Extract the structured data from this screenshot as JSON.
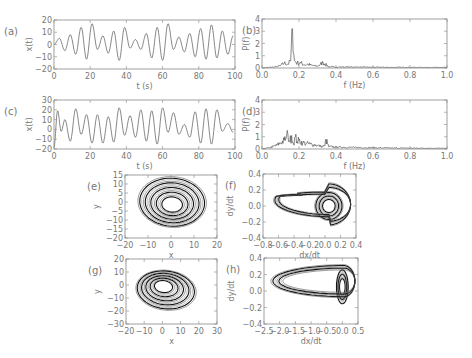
{
  "figure": {
    "width": 472,
    "height": 358,
    "frame_color": "#888888",
    "text_color": "#777777",
    "line_color_ts": "#555555",
    "line_color_phase": "#111111"
  },
  "chart_data": [
    {
      "id": "a",
      "panel_label": "(a)",
      "type": "line",
      "title": "",
      "xlabel": "t (s)",
      "ylabel": "x(t)",
      "xlim": [
        0,
        100
      ],
      "ylim": [
        -20,
        20
      ],
      "xticks": [
        0,
        20,
        40,
        60,
        80,
        100
      ],
      "yticks": [
        -20,
        -10,
        0,
        10,
        20
      ],
      "grid": false,
      "box": {
        "x": 54,
        "y": 20,
        "w": 181,
        "h": 49
      },
      "signal": {
        "kind": "chaotic_timeseries",
        "amplitude_range": [
          -14,
          17
        ],
        "approx_period_s": 6.0,
        "samples": 600
      },
      "x": [
        0,
        3,
        6,
        9,
        12,
        15,
        18,
        21,
        24,
        27,
        30,
        33,
        36,
        39,
        42,
        45,
        48,
        51,
        54,
        57,
        60,
        63,
        66,
        69,
        72,
        75,
        78,
        81,
        84,
        87,
        90,
        93,
        96,
        99
      ],
      "values": [
        0,
        5,
        -5,
        8,
        -8,
        14,
        -12,
        17,
        -4,
        7,
        -7,
        11,
        -13,
        14,
        -3,
        4,
        -4,
        9,
        -11,
        14,
        -13,
        17,
        -4,
        6,
        -6,
        9,
        -10,
        13,
        -12,
        16,
        -11,
        11,
        -8,
        7
      ]
    },
    {
      "id": "b",
      "panel_label": "(b)",
      "type": "line",
      "title": "",
      "xlabel": "f (Hz)",
      "ylabel": "P(f)",
      "xlim": [
        0.0,
        1.0
      ],
      "ylim": [
        0,
        4
      ],
      "xticks": [
        0.0,
        0.2,
        0.4,
        0.6,
        0.8,
        1.0
      ],
      "xtick_labels": [
        "0.0",
        "0.2",
        "0.4",
        "0.6",
        "0.8",
        "1.0"
      ],
      "yticks": [
        0,
        1,
        2,
        3,
        4
      ],
      "grid": false,
      "box": {
        "x": 262,
        "y": 19,
        "w": 185,
        "h": 49
      },
      "x": [
        0.0,
        0.04,
        0.08,
        0.1,
        0.12,
        0.14,
        0.155,
        0.165,
        0.175,
        0.19,
        0.21,
        0.23,
        0.25,
        0.27,
        0.3,
        0.33,
        0.36,
        0.4,
        0.5,
        0.6,
        0.7,
        0.8,
        0.9,
        1.0
      ],
      "values": [
        0.0,
        0.05,
        0.1,
        0.2,
        0.4,
        0.3,
        0.6,
        3.2,
        0.6,
        0.4,
        0.4,
        0.25,
        0.3,
        0.2,
        0.15,
        0.45,
        0.1,
        0.08,
        0.08,
        0.06,
        0.05,
        0.05,
        0.04,
        0.04
      ],
      "annotations": [
        {
          "text": "dominant peak",
          "x": 0.165,
          "y": 3.2
        }
      ]
    },
    {
      "id": "c",
      "panel_label": "(c)",
      "type": "line",
      "title": "",
      "xlabel": "t (s)",
      "ylabel": "x(t)",
      "xlim": [
        0,
        100
      ],
      "ylim": [
        -20,
        30
      ],
      "xticks": [
        0,
        20,
        40,
        60,
        80,
        100
      ],
      "yticks": [
        -20,
        -10,
        0,
        10,
        20,
        30
      ],
      "grid": false,
      "box": {
        "x": 54,
        "y": 100,
        "w": 181,
        "h": 49
      },
      "x": [
        0,
        2,
        4,
        6,
        9,
        12,
        15,
        18,
        21,
        24,
        27,
        30,
        33,
        36,
        39,
        42,
        45,
        48,
        51,
        54,
        57,
        60,
        63,
        66,
        69,
        72,
        75,
        78,
        81,
        84,
        87,
        90,
        93,
        96,
        99
      ],
      "values": [
        -18,
        19,
        -2,
        10,
        -12,
        21,
        -5,
        15,
        -14,
        15,
        -14,
        13,
        -13,
        22,
        -6,
        14,
        -8,
        20,
        -12,
        19,
        -15,
        22,
        -3,
        17,
        -5,
        5,
        -8,
        18,
        -14,
        21,
        -15,
        20,
        -2,
        6,
        -3
      ]
    },
    {
      "id": "d",
      "panel_label": "(d)",
      "type": "line",
      "title": "",
      "xlabel": "f (Hz)",
      "ylabel": "P(f)",
      "xlim": [
        0.0,
        1.0
      ],
      "ylim": [
        0,
        4
      ],
      "xticks": [
        0.0,
        0.2,
        0.4,
        0.6,
        0.8,
        1.0
      ],
      "xtick_labels": [
        "0.0",
        "0.2",
        "0.4",
        "0.6",
        "0.8",
        "1.0"
      ],
      "yticks": [
        0,
        1,
        2,
        3,
        4
      ],
      "grid": false,
      "box": {
        "x": 262,
        "y": 100,
        "w": 185,
        "h": 49
      },
      "x": [
        0.0,
        0.04,
        0.08,
        0.1,
        0.12,
        0.13,
        0.14,
        0.15,
        0.16,
        0.17,
        0.18,
        0.19,
        0.2,
        0.22,
        0.24,
        0.26,
        0.28,
        0.3,
        0.32,
        0.34,
        0.345,
        0.36,
        0.4,
        0.5,
        0.6,
        0.7,
        0.8,
        0.9,
        1.0
      ],
      "values": [
        0.0,
        0.1,
        0.3,
        0.5,
        0.7,
        0.9,
        1.2,
        0.6,
        1.1,
        0.4,
        1.0,
        0.6,
        0.7,
        0.5,
        0.45,
        0.4,
        0.35,
        0.3,
        0.2,
        0.25,
        0.8,
        0.2,
        0.15,
        0.12,
        0.1,
        0.08,
        0.07,
        0.06,
        0.05
      ]
    },
    {
      "id": "e",
      "panel_label": "(e)",
      "type": "scatter",
      "title": "",
      "xlabel": "x",
      "ylabel": "y",
      "xlim": [
        -20,
        20
      ],
      "ylim": [
        -20,
        15
      ],
      "xticks": [
        -20,
        -10,
        0,
        10,
        20
      ],
      "yticks": [
        -20,
        -15,
        -10,
        -5,
        0,
        5,
        10,
        15
      ],
      "grid": false,
      "box": {
        "x": 125,
        "y": 175,
        "w": 92,
        "h": 63
      },
      "attractor": {
        "center": [
          0,
          0
        ],
        "radius_x": [
          4,
          15
        ],
        "radius_y": [
          4,
          15
        ],
        "tilt_deg": -20,
        "loops": 14,
        "tail_to": [
          15,
          3
        ]
      }
    },
    {
      "id": "f",
      "panel_label": "(f)",
      "type": "scatter",
      "title": "",
      "xlabel": "dx/dt",
      "ylabel": "dy/dt",
      "xlim": [
        -0.8,
        0.4
      ],
      "ylim": [
        -0.4,
        0.4
      ],
      "xticks": [
        -0.8,
        -0.6,
        -0.4,
        -0.2,
        0.0,
        0.2,
        0.4
      ],
      "xtick_labels": [
        "-0.8",
        "-0.6",
        "-0.4",
        "-0.2",
        "0.0",
        "0.2",
        "0.4"
      ],
      "yticks": [
        -0.4,
        -0.2,
        0.0,
        0.2,
        0.4
      ],
      "ytick_labels": [
        "-0.4",
        "-0.2",
        "0.0",
        "0.2",
        "0.4"
      ],
      "grid": false,
      "box": {
        "x": 263,
        "y": 174,
        "w": 93,
        "h": 64
      },
      "attractor": {
        "center": [
          0.05,
          0.0
        ],
        "tip": [
          -0.78,
          0.18
        ],
        "loops": 14
      }
    },
    {
      "id": "g",
      "panel_label": "(g)",
      "type": "scatter",
      "title": "",
      "xlabel": "x",
      "ylabel": "y",
      "xlim": [
        -20,
        30
      ],
      "ylim": [
        -30,
        20
      ],
      "xticks": [
        -20,
        -10,
        0,
        10,
        20,
        30
      ],
      "yticks": [
        -30,
        -20,
        -10,
        0,
        10,
        20
      ],
      "grid": false,
      "box": {
        "x": 126,
        "y": 259,
        "w": 91,
        "h": 65
      },
      "attractor": {
        "center": [
          0,
          0
        ],
        "extent_x": [
          -16,
          22
        ],
        "extent_y": [
          -22,
          14
        ],
        "loops": 14
      }
    },
    {
      "id": "h",
      "panel_label": "(h)",
      "type": "scatter",
      "title": "",
      "xlabel": "dx/dt",
      "ylabel": "dy/dt",
      "xlim": [
        -2.5,
        0.5
      ],
      "ylim": [
        -0.4,
        0.4
      ],
      "xticks": [
        -2.5,
        -2.0,
        -1.5,
        -1.0,
        -0.5,
        0.0,
        0.5
      ],
      "xtick_labels": [
        "-2.5",
        "-2.0",
        "-1.5",
        "-1.0",
        "-0.5",
        "0.0",
        "0.5"
      ],
      "yticks": [
        -0.4,
        -0.2,
        0.0,
        0.2,
        0.4
      ],
      "ytick_labels": [
        "-0.4",
        "-0.2",
        "0.0",
        "0.2",
        "0.4"
      ],
      "grid": false,
      "box": {
        "x": 264,
        "y": 258,
        "w": 94,
        "h": 66
      },
      "attractor": {
        "center": [
          0.0,
          0.05
        ],
        "tip": [
          -2.2,
          0.12
        ],
        "loops": 14
      }
    }
  ]
}
